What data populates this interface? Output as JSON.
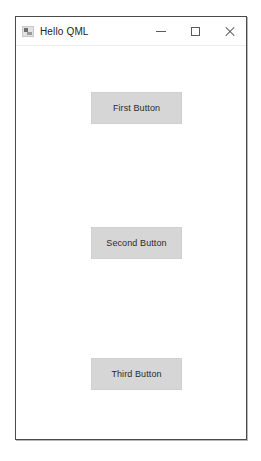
{
  "window": {
    "title": "Hello QML",
    "icon": "app-window-icon",
    "controls": [
      {
        "name": "minimize",
        "glyph": "—"
      },
      {
        "name": "maximize",
        "glyph": "□"
      },
      {
        "name": "close",
        "glyph": "✕"
      }
    ]
  },
  "main": {
    "buttons": [
      {
        "label": "First Button"
      },
      {
        "label": "Second Button"
      },
      {
        "label": "Third Button"
      }
    ]
  },
  "colors": {
    "window_border": "#4a4a4a",
    "titlebar_bg": "#ffffff",
    "client_bg": "#ffffff",
    "button_bg": "#d6d6d6",
    "button_border": "#d0d0d0",
    "text": "#2b2b2b"
  }
}
